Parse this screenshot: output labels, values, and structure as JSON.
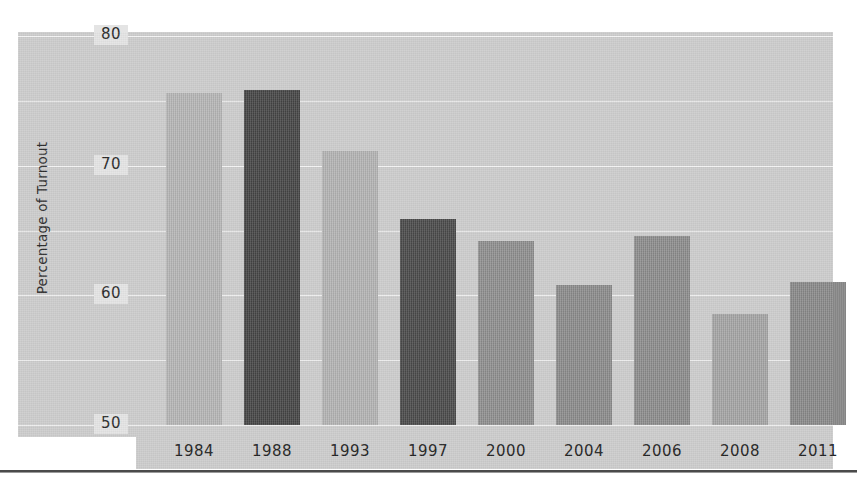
{
  "chart_data": {
    "type": "bar",
    "title": "",
    "xlabel": "",
    "ylabel": "Percentage of Turnout",
    "categories": [
      "1984",
      "1988",
      "1993",
      "1997",
      "2000",
      "2004",
      "2006",
      "2008",
      "2011"
    ],
    "values": [
      75.6,
      75.8,
      71.1,
      65.9,
      64.2,
      60.8,
      64.6,
      58.6,
      61.0
    ],
    "ylim": [
      50,
      80
    ],
    "y_major_ticks": [
      80,
      70,
      60,
      50
    ],
    "y_minor_gridlines": [
      75,
      65,
      55
    ],
    "y_tick_labels": [
      "80",
      "70",
      "60",
      "50"
    ],
    "grid": true,
    "legend": "none",
    "bar_colors": [
      "#b6b6b6",
      "#454545",
      "#b4b4b4",
      "#4a4a4a",
      "#8f8f8f",
      "#8c8c8c",
      "#8d8d8d",
      "#a5a5a5",
      "#8a8a8a"
    ],
    "series": [
      {
        "name": "Percentage of Turnout",
        "values": [
          75.6,
          75.8,
          71.1,
          65.9,
          64.2,
          60.8,
          64.6,
          58.6,
          61.0
        ]
      }
    ]
  },
  "colors": {
    "plot_background": "#cdcdcd",
    "page_background": "#ffffff",
    "gridline": "#ffffff",
    "tick_label_box": "#e4e4e4",
    "text": "#2a2a2a",
    "bottom_rule": "#4a4a4a",
    "bar_light": "#b6b6b6",
    "bar_dark": "#454545",
    "bar_medium": "#8d8d8d"
  },
  "axis": {
    "y_title": "Percentage of Turnout"
  }
}
